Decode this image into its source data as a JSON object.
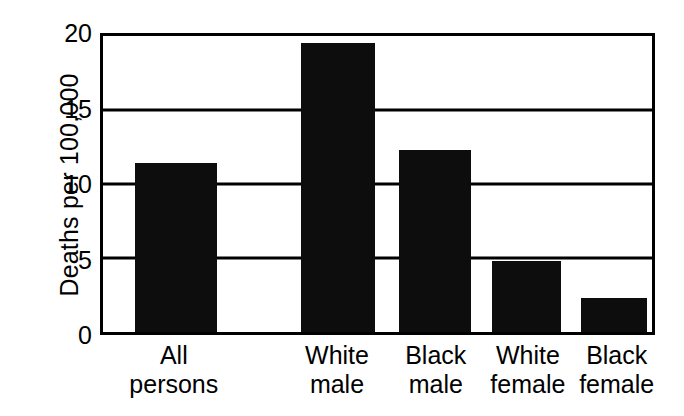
{
  "chart_data": {
    "type": "bar",
    "title": "",
    "subtitle": "",
    "xlabel": "",
    "ylabel": "Deaths per 100,000",
    "categories": [
      "All persons",
      "White male",
      "Black male",
      "White female",
      "Black female"
    ],
    "category_lines": [
      [
        "All",
        "persons"
      ],
      [
        "White",
        "male"
      ],
      [
        "Black",
        "male"
      ],
      [
        "White",
        "female"
      ],
      [
        "Black",
        "female"
      ]
    ],
    "values": [
      11.4,
      19.5,
      12.3,
      4.8,
      2.3
    ],
    "ylim": [
      0,
      20
    ],
    "yticks": [
      0,
      5,
      10,
      15,
      20
    ],
    "ytick_labels": [
      "0",
      "5",
      "10",
      "15",
      "20"
    ],
    "grid": true,
    "grid_axis": "y",
    "legend": false,
    "legend_position": "none",
    "bar_color": "#0d0d0d",
    "background_color": "#ffffff",
    "axis_color": "#000000"
  },
  "geometry": {
    "bar_left_pct": [
      5.8,
      36.0,
      54.0,
      70.8,
      87.0
    ],
    "bar_width_pct": [
      15.0,
      13.5,
      13.0,
      12.6,
      12.1
    ],
    "label_center_pct": [
      13.3,
      42.7,
      60.5,
      77.1,
      93.1
    ]
  }
}
